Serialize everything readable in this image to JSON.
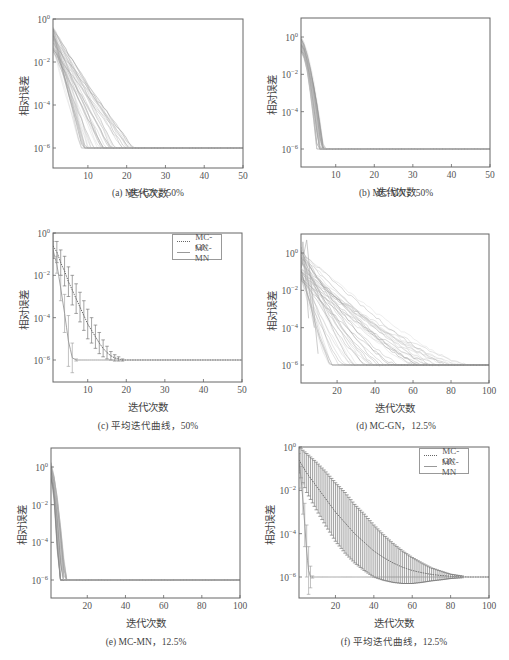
{
  "figure": {
    "panels": [
      {
        "id": "a",
        "caption": "(a) MC-GN，50%",
        "xlabel": "迭代次数",
        "ylabel": "相对误差",
        "xticks": [
          "10",
          "20",
          "30",
          "40",
          "50"
        ],
        "yticks": [
          "10^0",
          "10^-2",
          "10^-4",
          "10^-6"
        ]
      },
      {
        "id": "b",
        "caption": "(b) MC-MN，50%",
        "xlabel": "迭代次数",
        "ylabel": "相对误差",
        "xticks": [
          "10",
          "20",
          "30",
          "40",
          "50"
        ],
        "yticks": [
          "10^0",
          "10^-2",
          "10^-4",
          "10^-6"
        ]
      },
      {
        "id": "c",
        "caption": "(c) 平均迭代曲线，50%",
        "xlabel": "迭代次数",
        "ylabel": "相对误差",
        "xticks": [
          "10",
          "20",
          "30",
          "40",
          "50"
        ],
        "yticks": [
          "10^0",
          "10^-2",
          "10^-4",
          "10^-6"
        ],
        "legend": [
          "MC-GN",
          "MC-MN"
        ]
      },
      {
        "id": "d",
        "caption": "(d) MC-GN，12.5%",
        "xlabel": "迭代次数",
        "ylabel": "相对误差",
        "xticks": [
          "20",
          "40",
          "60",
          "80",
          "100"
        ],
        "yticks": [
          "10^0",
          "10^-2",
          "10^-4",
          "10^-6"
        ]
      },
      {
        "id": "e",
        "caption": "(e) MC-MN，12.5%",
        "xlabel": "迭代次数",
        "ylabel": "相对误差",
        "xticks": [
          "20",
          "40",
          "60",
          "80",
          "100"
        ],
        "yticks": [
          "10^0",
          "10^-2",
          "10^-4",
          "10^-6"
        ]
      },
      {
        "id": "f",
        "caption": "(f) 平均迭代曲线，12.5%",
        "xlabel": "迭代次数",
        "ylabel": "相对误差",
        "xticks": [
          "20",
          "40",
          "60",
          "80",
          "100"
        ],
        "yticks": [
          "10^0",
          "10^-2",
          "10^-4",
          "10^-6"
        ],
        "legend": [
          "MC-GN",
          "MC-MN"
        ]
      }
    ]
  },
  "chart_data": [
    {
      "id": "a",
      "type": "line",
      "title": "(a) MC-GN，50%",
      "xlabel": "迭代次数",
      "ylabel": "相对误差",
      "yscale": "log",
      "xlim": [
        1,
        50
      ],
      "ylim_log10": [
        0,
        -7.7
      ],
      "description": "~50 trial curves starting at ~1e-0.5..1e-1.5, decaying linearly in log scale, reaching 1e-6 floor between iterations 8 and 22",
      "series_summary": {
        "start_log10_range": [
          -0.3,
          -1.5
        ],
        "converge_iter_range": [
          8,
          22
        ],
        "floor_log10": -6
      }
    },
    {
      "id": "b",
      "type": "line",
      "title": "(b) MC-MN，50%",
      "xlabel": "迭代次数",
      "ylabel": "相对误差",
      "yscale": "log",
      "xlim": [
        1,
        50
      ],
      "ylim_log10": [
        1,
        -8
      ],
      "description": "~50 trial curves converging steeply to 1e-6 floor by iterations 5-7",
      "series_summary": {
        "start_log10_range": [
          0,
          -0.8
        ],
        "converge_iter_range": [
          5,
          7
        ],
        "floor_log10": -6
      }
    },
    {
      "id": "c",
      "type": "line",
      "title": "(c) 平均迭代曲线，50%",
      "xlabel": "迭代次数",
      "ylabel": "相对误差",
      "yscale": "log",
      "xlim": [
        1,
        50
      ],
      "ylim_log10": [
        0,
        -7
      ],
      "legend": [
        "MC-GN",
        "MC-MN"
      ],
      "legend_position": "upper right",
      "series": [
        {
          "name": "MC-GN",
          "style": "dotted",
          "x": [
            1,
            2,
            3,
            4,
            5,
            6,
            7,
            8,
            9,
            10,
            11,
            12,
            13,
            14,
            15,
            16,
            17,
            18,
            19,
            20,
            22,
            25,
            30,
            40,
            50
          ],
          "log10_mean": [
            -0.6,
            -0.9,
            -1.4,
            -1.8,
            -2.3,
            -2.7,
            -3.1,
            -3.5,
            -3.9,
            -4.3,
            -4.6,
            -4.9,
            -5.2,
            -5.45,
            -5.65,
            -5.8,
            -5.9,
            -5.95,
            -6,
            -6,
            -6,
            -6,
            -6,
            -6,
            -6
          ],
          "log10_err": [
            0.6,
            0.5,
            0.6,
            0.7,
            0.7,
            0.7,
            0.7,
            0.7,
            0.7,
            0.7,
            0.6,
            0.55,
            0.5,
            0.4,
            0.3,
            0.2,
            0.15,
            0.1,
            0.05,
            0.03,
            0,
            0,
            0,
            0,
            0
          ]
        },
        {
          "name": "MC-MN",
          "style": "solid",
          "x": [
            1,
            2,
            3,
            4,
            5,
            6,
            7,
            8,
            10,
            20,
            30,
            40,
            50
          ],
          "log10_mean": [
            -0.8,
            -1.5,
            -2.6,
            -3.8,
            -5.1,
            -5.9,
            -6,
            -6,
            -6,
            -6,
            -6,
            -6,
            -6
          ],
          "log10_err": [
            0.4,
            0.4,
            0.6,
            0.9,
            1.2,
            0.7,
            0.05,
            0,
            0,
            0,
            0,
            0,
            0
          ]
        }
      ]
    },
    {
      "id": "d",
      "type": "line",
      "title": "(d) MC-GN，12.5%",
      "xlabel": "迭代次数",
      "ylabel": "相对误差",
      "yscale": "log",
      "xlim": [
        1,
        100
      ],
      "ylim_log10": [
        1,
        -7
      ],
      "description": "~50 trial curves starting ~1e0..1e-1.5, decaying slowly, reaching 1e-6 floor between iterations 15 and 90",
      "series_summary": {
        "start_log10_range": [
          0.3,
          -1.5
        ],
        "converge_iter_range": [
          15,
          90
        ],
        "floor_log10": -6
      }
    },
    {
      "id": "e",
      "type": "line",
      "title": "(e) MC-MN，12.5%",
      "xlabel": "迭代次数",
      "ylabel": "相对误差",
      "yscale": "log",
      "xlim": [
        1,
        100
      ],
      "ylim_log10": [
        1,
        -7
      ],
      "description": "~50 trial curves converging very fast to 1e-6 floor by iterations 5-9",
      "series_summary": {
        "start_log10_range": [
          0.2,
          -0.6
        ],
        "converge_iter_range": [
          5,
          9
        ],
        "floor_log10": -6
      }
    },
    {
      "id": "f",
      "type": "line",
      "title": "(f) 平均迭代曲线，12.5%",
      "xlabel": "迭代次数",
      "ylabel": "相对误差",
      "yscale": "log",
      "xlim": [
        1,
        100
      ],
      "ylim_log10": [
        0,
        -7
      ],
      "legend": [
        "MC-GN",
        "MC-MN"
      ],
      "legend_position": "upper right",
      "series": [
        {
          "name": "MC-GN",
          "style": "dotted",
          "x": [
            1,
            5,
            10,
            15,
            20,
            25,
            30,
            35,
            40,
            45,
            50,
            55,
            60,
            65,
            70,
            75,
            80,
            85,
            90,
            100
          ],
          "log10_mean": [
            -0.6,
            -1.2,
            -1.8,
            -2.4,
            -3.0,
            -3.5,
            -4.0,
            -4.4,
            -4.8,
            -5.1,
            -5.35,
            -5.55,
            -5.7,
            -5.8,
            -5.88,
            -5.93,
            -5.97,
            -5.99,
            -6,
            -6
          ],
          "log10_err": [
            0.6,
            0.9,
            1.1,
            1.25,
            1.35,
            1.4,
            1.35,
            1.3,
            1.2,
            1.05,
            0.9,
            0.75,
            0.6,
            0.45,
            0.3,
            0.2,
            0.1,
            0.05,
            0.02,
            0
          ]
        },
        {
          "name": "MC-MN",
          "style": "solid",
          "x": [
            1,
            2,
            3,
            4,
            5,
            6,
            7,
            8,
            9,
            10,
            20,
            40,
            60,
            80,
            100
          ],
          "log10_mean": [
            -0.7,
            -1.4,
            -2.4,
            -3.6,
            -4.8,
            -5.7,
            -6,
            -6,
            -6,
            -6,
            -6,
            -6,
            -6,
            -6,
            -6
          ],
          "log10_err": [
            0.4,
            0.5,
            0.7,
            1.0,
            1.2,
            1.1,
            0.5,
            0.05,
            0,
            0,
            0,
            0,
            0,
            0,
            0
          ]
        }
      ]
    }
  ]
}
